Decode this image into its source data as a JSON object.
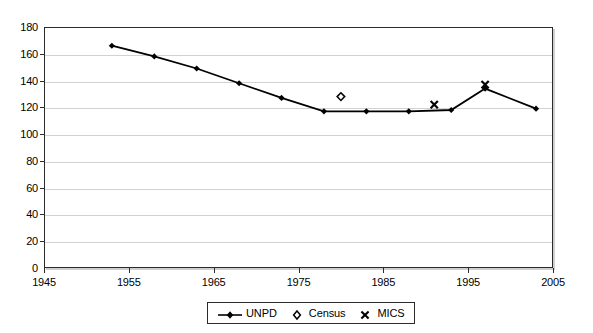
{
  "chart_data": {
    "type": "line",
    "title": "",
    "subtitle": "",
    "xlabel": "",
    "ylabel": "",
    "xlim": [
      1945,
      2005
    ],
    "ylim": [
      0,
      180
    ],
    "xticks": [
      1945,
      1955,
      1965,
      1975,
      1985,
      1995,
      2005
    ],
    "yticks": [
      0,
      20,
      40,
      60,
      80,
      100,
      120,
      140,
      160,
      180
    ],
    "grid": "horizontal",
    "legend_position": "bottom-center",
    "series": [
      {
        "name": "UNPD",
        "marker": "filled-diamond",
        "line": true,
        "x": [
          1953,
          1958,
          1963,
          1968,
          1973,
          1978,
          1983,
          1988,
          1993,
          1997,
          2003
        ],
        "values": [
          166,
          158,
          149,
          138,
          127,
          117,
          117,
          117,
          118,
          134,
          119
        ]
      },
      {
        "name": "Census",
        "marker": "open-diamond",
        "line": false,
        "x": [
          1980
        ],
        "values": [
          128
        ]
      },
      {
        "name": "MICS",
        "marker": "cross",
        "line": false,
        "x": [
          1991,
          1997
        ],
        "values": [
          122,
          137
        ]
      }
    ]
  },
  "axes": {
    "y_tick_labels": [
      "180",
      "160",
      "140",
      "120",
      "100",
      "80",
      "60",
      "40",
      "20",
      "0"
    ],
    "x_tick_labels": [
      "1945",
      "1955",
      "1965",
      "1975",
      "1985",
      "1995",
      "2005"
    ]
  },
  "legend": {
    "items": [
      {
        "label": "UNPD",
        "symbol": "line-with-filled-diamond"
      },
      {
        "label": "Census",
        "symbol": "open-diamond"
      },
      {
        "label": "MICS",
        "symbol": "cross"
      }
    ]
  },
  "colors": {
    "series": "#000000",
    "axis": "#2b2b2b",
    "grid": "#d2d2d2",
    "background": "#ffffff"
  }
}
